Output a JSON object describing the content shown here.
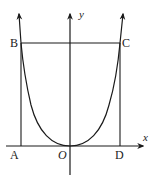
{
  "figure": {
    "type": "coordinate-diagram",
    "colors": {
      "stroke": "#1a1a1a",
      "label": "#222222",
      "background": "#ffffff"
    },
    "axes": {
      "x_label": "x",
      "y_label": "y",
      "origin_label": "O"
    },
    "points": {
      "A": "A",
      "B": "B",
      "C": "C",
      "D": "D"
    }
  }
}
